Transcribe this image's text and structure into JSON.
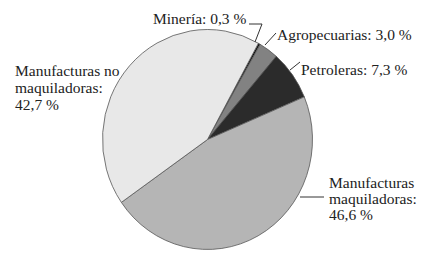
{
  "chart_data": {
    "type": "pie",
    "title": "",
    "slices": [
      {
        "name": "Minería",
        "value": 0.3,
        "label": "Minería: 0,3 %",
        "color": "#111111"
      },
      {
        "name": "Agropecuarias",
        "value": 3.0,
        "label": "Agropecuarias: 3,0 %",
        "color": "#828282"
      },
      {
        "name": "Petroleras",
        "value": 7.3,
        "label": "Petroleras: 7,3 %",
        "color": "#2b2b2b"
      },
      {
        "name": "Manufacturas maquiladoras",
        "value": 46.6,
        "label_lines": [
          "Manufacturas",
          "maquiladoras:",
          "46,6 %"
        ],
        "color": "#b5b5b5"
      },
      {
        "name": "Manufacturas no maquiladoras",
        "value": 42.7,
        "label_lines": [
          "Manufacturas no",
          "maquiladoras:",
          "42,7 %"
        ],
        "color": "#e8e8e8"
      }
    ],
    "start_angle_deg": 29,
    "direction": "clockwise",
    "legend": "none (direct labels with leader lines)"
  },
  "labels": {
    "mineria": "Minería: 0,3 %",
    "agro": "Agropecuarias: 3,0 %",
    "petro": "Petroleras: 7,3 %",
    "maq": [
      "Manufacturas",
      "maquiladoras:",
      "46,6 %"
    ],
    "nomaq": [
      "Manufacturas no",
      "maquiladoras:",
      "42,7 %"
    ]
  }
}
